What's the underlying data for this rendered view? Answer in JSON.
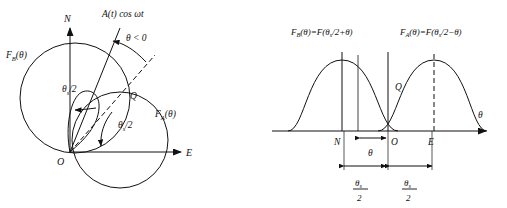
{
  "figure": {
    "title_hidden": "",
    "panels": [
      {
        "id": "left-panel",
        "kind": "polar-circle-diagram",
        "axes": {
          "vertical_label": "N",
          "horizontal_label": "E",
          "origin_label": "O"
        },
        "curves": [
          {
            "name": "circle-FB",
            "label": "F",
            "label_sub": "B",
            "label_arg": "(θ)"
          },
          {
            "name": "circle-FA",
            "label": "F",
            "label_sub": "A",
            "label_arg": "(θ)"
          }
        ],
        "annotations": {
          "signal_label": "A(t) cos ωt",
          "angle_condition": "θ < 0",
          "half_squint_upper": {
            "sym": "θ",
            "sub": "s",
            "rest": "/2"
          },
          "half_squint_lower": {
            "sym": "θ",
            "sub": "s",
            "rest": "/2"
          },
          "intersection_point": "Q"
        }
      },
      {
        "id": "right-panel",
        "kind": "cartesian-pattern-plot",
        "axis": {
          "x_label": "θ",
          "tick_labels": [
            "N",
            "O",
            "E"
          ]
        },
        "equations": [
          {
            "name": "FB-equation",
            "lhs_sym": "F",
            "lhs_sub": "B",
            "lhs_arg": "(θ)",
            "eq": "=",
            "rhs_head": "F(",
            "rhs_sym": "θ",
            "rhs_sub": "s",
            "rhs_tail": "/2+θ)"
          },
          {
            "name": "FA-equation",
            "lhs_sym": "F",
            "lhs_sub": "A",
            "lhs_arg": "(θ)",
            "eq": "=",
            "rhs_head": "F(",
            "rhs_sym": "θ",
            "rhs_sub": "s",
            "rhs_tail": "/2−θ)"
          }
        ],
        "annotations": {
          "intersection_point": "Q",
          "offset_label": "θ",
          "fraction_left": {
            "num_sym": "θ",
            "num_sub": "s",
            "den": "2"
          },
          "fraction_right": {
            "num_sym": "θ",
            "num_sub": "s",
            "den": "2"
          }
        }
      }
    ],
    "colors": {
      "stroke": "#111111",
      "background": "#ffffff"
    }
  }
}
